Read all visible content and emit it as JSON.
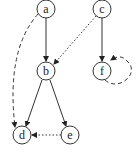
{
  "nodes": [
    {
      "id": "a",
      "label": "a",
      "x": 46,
      "y": 9
    },
    {
      "id": "c",
      "label": "c",
      "x": 102,
      "y": 9
    },
    {
      "id": "b",
      "label": "b",
      "x": 46,
      "y": 71
    },
    {
      "id": "f",
      "label": "f",
      "x": 102,
      "y": 71
    },
    {
      "id": "d",
      "label": "d",
      "x": 22,
      "y": 135
    },
    {
      "id": "e",
      "label": "e",
      "x": 70,
      "y": 135
    }
  ],
  "edges": [
    {
      "from": "a",
      "to": "b",
      "style": "solid"
    },
    {
      "from": "c",
      "to": "f",
      "style": "solid"
    },
    {
      "from": "c",
      "to": "b",
      "style": "dotted"
    },
    {
      "from": "b",
      "to": "d",
      "style": "solid"
    },
    {
      "from": "b",
      "to": "e",
      "style": "solid"
    },
    {
      "from": "e",
      "to": "d",
      "style": "dotted"
    },
    {
      "from": "a",
      "to": "d",
      "style": "dashed",
      "curved": true
    },
    {
      "from": "f",
      "to": "f",
      "style": "dashed",
      "self_loop": true
    }
  ]
}
